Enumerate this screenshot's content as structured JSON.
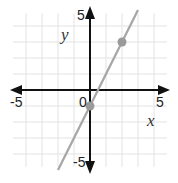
{
  "chart_data": {
    "type": "line",
    "title": "",
    "xlabel": "x",
    "ylabel": "y",
    "xlim": [
      -5,
      5
    ],
    "ylim": [
      -5,
      5
    ],
    "grid": true,
    "x_tick_labels": [
      "-5",
      "0",
      "5"
    ],
    "y_tick_labels": [
      "5",
      "-5"
    ],
    "series": [
      {
        "name": "line",
        "equation": "y = 2x - 1",
        "x": [
          -2,
          3
        ],
        "y": [
          -5,
          5
        ],
        "color": "#a6a6a6"
      }
    ],
    "points": [
      {
        "x": 0,
        "y": -1
      },
      {
        "x": 2,
        "y": 3
      }
    ],
    "colors": {
      "grid": "#e3e3e3",
      "axis": "#111111",
      "line": "#a6a6a6",
      "point": "#9a9a9a"
    }
  },
  "labels": {
    "x_axis": "x",
    "y_axis": "y",
    "x_min": "-5",
    "x_max": "5",
    "origin": "0",
    "y_max": "5",
    "y_min": "-5"
  }
}
